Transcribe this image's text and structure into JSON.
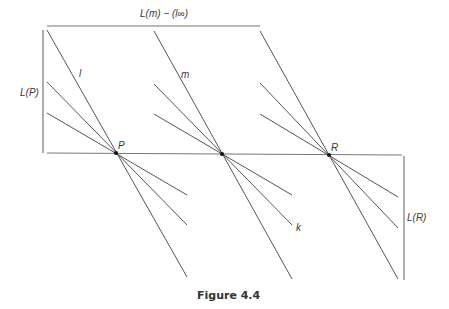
{
  "figure": {
    "caption": "Figure 4.4",
    "labels": {
      "top_bracket": "L(m) − (l∞)",
      "left_bracket": "L(P)",
      "right_bracket": "L(R)",
      "line_l": "l",
      "line_m": "m",
      "line_k": "k",
      "point_P": "P",
      "point_R": "R"
    },
    "points": {
      "P": [
        116,
        153
      ],
      "Q": [
        222,
        154
      ],
      "R": [
        329,
        155
      ]
    },
    "colors": {
      "line": "#555555",
      "bracket": "#777777",
      "text": "#3a3a3a",
      "background": "#ffffff"
    }
  }
}
